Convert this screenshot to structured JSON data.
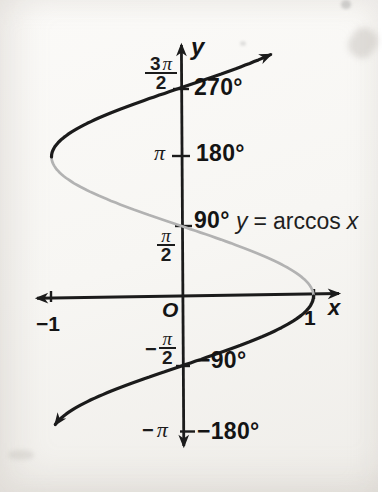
{
  "figure_description": "Graph of y = arccos x showing all branches of x = cos y; principal branch drawn in gray",
  "colors": {
    "ink": "#1b1b1b",
    "principal_branch_gray": "#b2b2b2",
    "paper": "#f7f6f3"
  },
  "labels": {
    "axis": {
      "y": "y",
      "x": "x",
      "origin": "O"
    },
    "x_ticks": {
      "neg_one": "−1",
      "pos_one": "1"
    },
    "radians": {
      "three_pi_over_two": {
        "coeff": "3",
        "pi": "π",
        "den": "2"
      },
      "pi": "π",
      "pi_over_two": {
        "pi": "π",
        "den": "2"
      },
      "neg_pi_over_two": {
        "minus": "−",
        "pi": "π",
        "den": "2"
      },
      "neg_pi": {
        "minus": "−",
        "pi": "π"
      }
    },
    "degrees": {
      "d270": "270°",
      "d180": "180°",
      "d90": "90°",
      "dm90": "−90°",
      "dm180": "−180°"
    },
    "equation": {
      "lhs": "y",
      "equals": "=",
      "fn": "arccos",
      "arg": "x"
    }
  },
  "chart_data": {
    "type": "line",
    "title": "y = arccos x",
    "xlabel": "x",
    "ylabel": "y",
    "relation_plotted": "x = cos y (all branches of the inverse cosine relation)",
    "x_domain": [
      -1,
      1
    ],
    "y_range_plotted_radians": [
      -2.9,
      5.45
    ],
    "x_axis_ticks": [
      -1,
      1
    ],
    "y_axis_ticks": [
      {
        "radians": "−π",
        "degrees": "−180°",
        "value": -3.14159
      },
      {
        "radians": "−π/2",
        "degrees": "−90°",
        "value": -1.5708
      },
      {
        "radians": "π/2",
        "degrees": "90°",
        "value": 1.5708
      },
      {
        "radians": "π",
        "degrees": "180°",
        "value": 3.14159
      },
      {
        "radians": "3π/2",
        "degrees": "270°",
        "value": 4.71239
      }
    ],
    "key_points": [
      [
        1,
        0
      ],
      [
        0,
        1.5708
      ],
      [
        -1,
        3.14159
      ],
      [
        0,
        4.71239
      ],
      [
        0,
        -1.5708
      ],
      [
        -1,
        -3.14159
      ]
    ],
    "series": [
      {
        "id": "principal",
        "name": "principal branch y = arccos x",
        "color": "#b2b2b2",
        "t_from": 0,
        "t_to": 3.14159,
        "arrow_end": false,
        "points": [
          [
            1,
            0
          ],
          [
            0.707,
            0.785
          ],
          [
            0,
            1.571
          ],
          [
            -0.707,
            2.356
          ],
          [
            -1,
            3.142
          ]
        ]
      },
      {
        "id": "lower",
        "name": "lower branch",
        "color": "#1b1b1b",
        "t_from": 0,
        "t_to": -2.9,
        "arrow_end": true,
        "points": [
          [
            1,
            0
          ],
          [
            0,
            -1.571
          ],
          [
            -0.97,
            -2.9
          ]
        ]
      },
      {
        "id": "upper",
        "name": "upper branch",
        "color": "#1b1b1b",
        "t_from": 3.14159,
        "t_to": 5.45,
        "arrow_end": true,
        "points": [
          [
            -1,
            3.142
          ],
          [
            0,
            4.712
          ],
          [
            0.68,
            5.45
          ]
        ]
      }
    ],
    "layout": {
      "origin_px": [
        182.5,
        296
      ],
      "px_per_x_unit": 131,
      "px_per_radian": 44.3,
      "grid": false,
      "legend": false
    }
  }
}
